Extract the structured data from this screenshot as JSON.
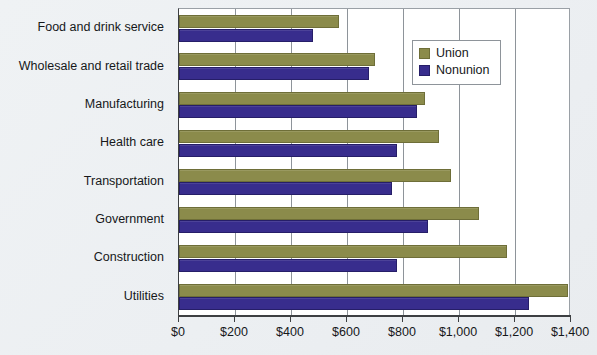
{
  "chart_data": {
    "type": "bar",
    "orientation": "horizontal",
    "title": "",
    "xlabel": "",
    "ylabel": "",
    "xlim": [
      0,
      1400
    ],
    "xticks": [
      0,
      200,
      400,
      600,
      800,
      1000,
      1200,
      1400
    ],
    "xtick_labels": [
      "$0",
      "$200",
      "$400",
      "$600",
      "$800",
      "$1,000",
      "$1,200",
      "$1,400"
    ],
    "grid": true,
    "grid_axis": "x",
    "legend_position": "top-right-inside",
    "categories": [
      "Food and drink service",
      "Wholesale and retail trade",
      "Manufacturing",
      "Health care",
      "Transportation",
      "Government",
      "Construction",
      "Utilities"
    ],
    "series": [
      {
        "name": "Union",
        "color": "#8b8b4b",
        "values": [
          570,
          700,
          880,
          930,
          970,
          1070,
          1170,
          1390
        ]
      },
      {
        "name": "Nonunion",
        "color": "#382d8d",
        "values": [
          480,
          680,
          850,
          780,
          760,
          890,
          780,
          1250
        ]
      }
    ]
  },
  "legend": {
    "items": [
      {
        "label": "Union",
        "color": "#8b8b4b"
      },
      {
        "label": "Nonunion",
        "color": "#382d8d"
      }
    ]
  },
  "colors": {
    "union": "#8b8b4b",
    "nonunion": "#382d8d",
    "plot_background": "#ffffff",
    "page_background": "#eef1f4",
    "axis": "#3d3f42",
    "gridline": "#8e949a",
    "text": "#16181a"
  }
}
